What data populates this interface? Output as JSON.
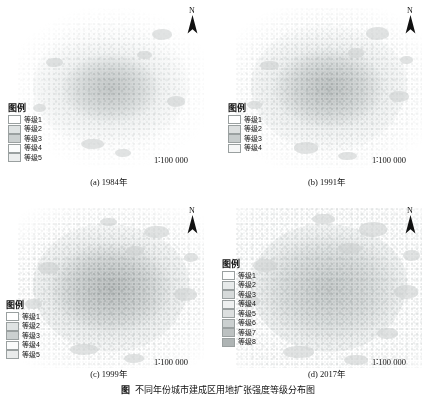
{
  "figure": {
    "caption_label": "图",
    "caption_text": "不同年份城市建成区用地扩张强度等级分布图"
  },
  "legend_title": "图例",
  "scale_text": "1∶100 000",
  "north_label": "N",
  "swatch_colors": [
    "#ffffff",
    "#e2e6e6",
    "#ced3d3",
    "#f2f4f4",
    "#dde1e1",
    "#c5caca",
    "#b6bbbb",
    "#a7adad"
  ],
  "panels": [
    {
      "id": "a",
      "caption": "(a) 1984年",
      "legend_title": "图例",
      "legend_items": [
        {
          "label": "等级1",
          "color": "#ffffff"
        },
        {
          "label": "等级2",
          "color": "#dfe3e3"
        },
        {
          "label": "等级3",
          "color": "#cbd0d0"
        },
        {
          "label": "等级4",
          "color": "#fbfcfc"
        },
        {
          "label": "等级5",
          "color": "#eceeee"
        }
      ],
      "scale": "1∶100 000",
      "north": "N"
    },
    {
      "id": "b",
      "caption": "(b) 1991年",
      "legend_title": "图例",
      "legend_items": [
        {
          "label": "等级1",
          "color": "#ffffff"
        },
        {
          "label": "等级2",
          "color": "#dcdfdf"
        },
        {
          "label": "等级3",
          "color": "#c7cccc"
        },
        {
          "label": "等级4",
          "color": "#f6f7f7"
        }
      ],
      "scale": "1∶100 000",
      "north": "N"
    },
    {
      "id": "c",
      "caption": "(c) 1999年",
      "legend_title": "图例",
      "legend_items": [
        {
          "label": "等级1",
          "color": "#ffffff"
        },
        {
          "label": "等级2",
          "color": "#dfe3e3"
        },
        {
          "label": "等级3",
          "color": "#cbd0d0"
        },
        {
          "label": "等级4",
          "color": "#fafbfb"
        },
        {
          "label": "等级5",
          "color": "#e9ebeb"
        }
      ],
      "scale": "1∶100 000",
      "north": "N"
    },
    {
      "id": "d",
      "caption": "(d) 2017年",
      "legend_title": "图例",
      "legend_items": [
        {
          "label": "等级1",
          "color": "#fcfdfd"
        },
        {
          "label": "等级2",
          "color": "#e7eaea"
        },
        {
          "label": "等级3",
          "color": "#d6dada"
        },
        {
          "label": "等级4",
          "color": "#eef0f0"
        },
        {
          "label": "等级5",
          "color": "#dcdfdf"
        },
        {
          "label": "等级6",
          "color": "#cbd0d0"
        },
        {
          "label": "等级7",
          "color": "#bcc1c1"
        },
        {
          "label": "等级8",
          "color": "#aeb4b4"
        }
      ],
      "scale": "1∶100 000",
      "north": "N"
    }
  ]
}
